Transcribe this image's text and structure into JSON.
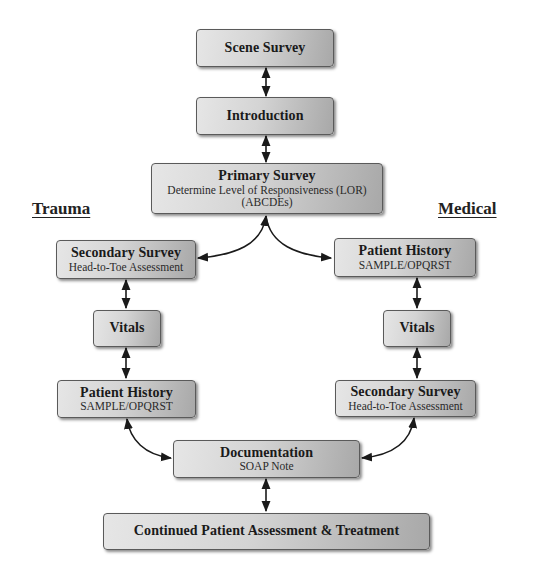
{
  "labels": {
    "trauma": "Trauma",
    "medical": "Medical"
  },
  "nodes": {
    "scene_survey": {
      "title": "Scene Survey"
    },
    "introduction": {
      "title": "Introduction"
    },
    "primary_survey": {
      "title": "Primary Survey",
      "sub1": "Determine Level of Responsiveness (LOR)",
      "sub2": "(ABCDEs)"
    },
    "trauma_secondary_survey": {
      "title": "Secondary Survey",
      "sub": "Head-to-Toe Assessment"
    },
    "trauma_vitals": {
      "title": "Vitals"
    },
    "trauma_patient_history": {
      "title": "Patient History",
      "sub": "SAMPLE/OPQRST"
    },
    "medical_patient_history": {
      "title": "Patient History",
      "sub": "SAMPLE/OPQRST"
    },
    "medical_vitals": {
      "title": "Vitals"
    },
    "medical_secondary_survey": {
      "title": "Secondary Survey",
      "sub": "Head-to-Toe Assessment"
    },
    "documentation": {
      "title": "Documentation",
      "sub": "SOAP Note"
    },
    "continued": {
      "title": "Continued Patient Assessment & Treatment"
    }
  },
  "edges": [
    {
      "from": "scene_survey",
      "to": "introduction",
      "type": "bidirectional"
    },
    {
      "from": "introduction",
      "to": "primary_survey",
      "type": "bidirectional"
    },
    {
      "from": "primary_survey",
      "to": "trauma_secondary_survey",
      "type": "bidirectional-curved"
    },
    {
      "from": "primary_survey",
      "to": "medical_patient_history",
      "type": "bidirectional-curved"
    },
    {
      "from": "trauma_secondary_survey",
      "to": "trauma_vitals",
      "type": "bidirectional"
    },
    {
      "from": "trauma_vitals",
      "to": "trauma_patient_history",
      "type": "bidirectional"
    },
    {
      "from": "medical_patient_history",
      "to": "medical_vitals",
      "type": "bidirectional"
    },
    {
      "from": "medical_vitals",
      "to": "medical_secondary_survey",
      "type": "bidirectional"
    },
    {
      "from": "trauma_patient_history",
      "to": "documentation",
      "type": "bidirectional-curved"
    },
    {
      "from": "medical_secondary_survey",
      "to": "documentation",
      "type": "bidirectional-curved"
    },
    {
      "from": "documentation",
      "to": "continued",
      "type": "bidirectional"
    }
  ],
  "colors": {
    "box_light": "#e6e6e6",
    "box_dark": "#a8a8a8",
    "box_border": "#5a5a5a",
    "arrow": "#1a1a1a"
  }
}
